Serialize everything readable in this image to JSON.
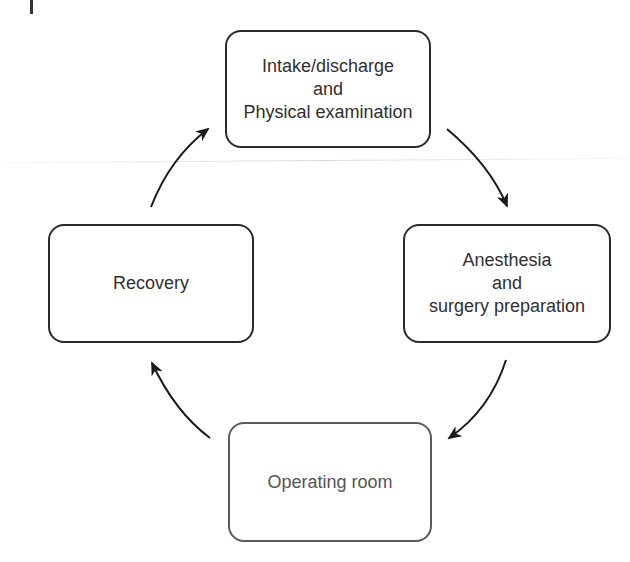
{
  "diagram": {
    "type": "cycle",
    "nodes": [
      {
        "id": "intake",
        "label": "Intake/discharge\nand\nPhysical examination"
      },
      {
        "id": "anesthesia",
        "label": "Anesthesia\nand\nsurgery preparation"
      },
      {
        "id": "operating",
        "label": "Operating room"
      },
      {
        "id": "recovery",
        "label": "Recovery"
      }
    ],
    "edges": [
      {
        "from": "intake",
        "to": "anesthesia"
      },
      {
        "from": "anesthesia",
        "to": "operating"
      },
      {
        "from": "operating",
        "to": "recovery"
      },
      {
        "from": "recovery",
        "to": "intake"
      }
    ],
    "colors": {
      "stroke": "#2a2a2a",
      "text": "#2f2f2f",
      "background": "#ffffff"
    }
  }
}
